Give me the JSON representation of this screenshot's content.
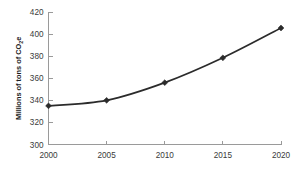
{
  "chart_data": {
    "type": "line",
    "title": "",
    "subtitle": "",
    "xlabel": "",
    "ylabel": "Millions of tons of CO2e",
    "ylabel_parts": {
      "prefix": "Millions of tons of CO",
      "subscript": "2",
      "suffix": "e"
    },
    "categories": [
      "2000",
      "2005",
      "2010",
      "2015",
      "2020"
    ],
    "x": [
      2000,
      2005,
      2010,
      2015,
      2020
    ],
    "values": [
      335,
      340,
      356,
      378.5,
      405.5
    ],
    "series": [
      {
        "name": "CO2e emissions",
        "values": [
          335,
          340,
          356,
          378.5,
          405.5
        ]
      }
    ],
    "ylim": [
      300,
      420
    ],
    "xlim": [
      2000,
      2020
    ],
    "yticks": [
      300,
      320,
      340,
      360,
      380,
      400,
      420
    ],
    "ytick_labels": [
      "300",
      "320",
      "340",
      "360",
      "380",
      "400",
      "420"
    ],
    "xticks": [
      2000,
      2005,
      2010,
      2015,
      2020
    ],
    "xtick_labels": [
      "2000",
      "2005",
      "2010",
      "2015",
      "2020"
    ],
    "grid": false,
    "legend": false,
    "legend_position": "none",
    "marker": "diamond",
    "line_color": "#2b2b2b",
    "marker_color": "#2b2b2b",
    "axis_color": "#9a9a9a",
    "background_color": "#ffffff",
    "annotations": []
  }
}
